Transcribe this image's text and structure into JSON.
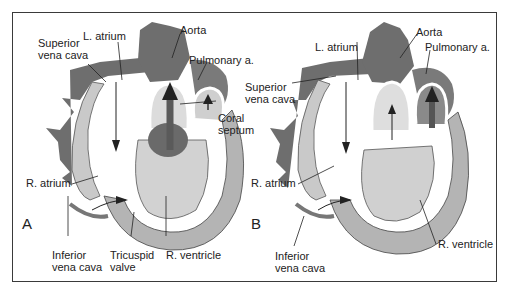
{
  "figure": {
    "panels": [
      {
        "id": "A",
        "letter": "A",
        "labels": {
          "superior_vena_cava": "Superior\nvena cava",
          "l_atrium": "L. atrium",
          "aorta": "Aorta",
          "pulmonary_a": "Pulmonary a.",
          "coral_septum": "Coral\nseptum",
          "r_atrium": "R. atrium",
          "inferior_vena_cava": "Inferior\nvena cava",
          "tricuspid_valve": "Tricuspid\nvalve",
          "r_ventricle": "R. ventricle"
        }
      },
      {
        "id": "B",
        "letter": "B",
        "labels": {
          "superior_vena_cava": "Superior\nvena cava",
          "l_atrium": "L. atrium",
          "aorta": "Aorta",
          "pulmonary_a": "Pulmonary a.",
          "r_atrium": "R. atrium",
          "inferior_vena_cava": "Inferior\nvena cava",
          "r_ventricle": "R. ventricle"
        }
      }
    ],
    "colors": {
      "vessel_dark": "#6e6e6e",
      "tissue_light": "#d6d6d6",
      "muscle_mid": "#b4b4b4",
      "frame": "#3a3a3a",
      "text": "#222222"
    }
  }
}
